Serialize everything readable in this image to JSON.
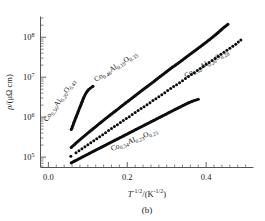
{
  "figure": {
    "panel_label": "(b)",
    "background": "#ffffff",
    "marker_color": "#0d0d0d"
  },
  "axes": {
    "x": {
      "title_base": "T",
      "title_exp": "-1/2",
      "title_unit_open": "/(K",
      "title_unit_exp": "-1/2",
      "title_unit_close": ")",
      "ticks": [
        "0.0",
        "0.2",
        "0.4"
      ],
      "tick_values": [
        0.0,
        0.2,
        0.4
      ],
      "range": [
        -0.02,
        0.52
      ]
    },
    "y": {
      "title_rho": "ρ",
      "title_rest": "/(μΩ cm)",
      "ticks": [
        "10",
        "10",
        "10",
        "10"
      ],
      "tick_exponents": [
        "5",
        "6",
        "7",
        "8"
      ],
      "tick_values": [
        100000,
        1000000,
        10000000,
        100000000
      ],
      "range": [
        55000,
        330000000
      ]
    }
  },
  "chart_data": {
    "type": "scatter",
    "title": "",
    "subtitle": "(b)",
    "xlabel": "T^-1/2 / (K^-1/2)",
    "ylabel": "rho / (micro-ohm cm)",
    "xscale": "linear",
    "yscale": "log",
    "xlim": [
      -0.02,
      0.52
    ],
    "ylim": [
      55000,
      330000000
    ],
    "xticks": [
      0.0,
      0.2,
      0.4
    ],
    "yticks": [
      100000,
      1000000,
      10000000,
      100000000
    ],
    "grid": false,
    "legend": "inline-annotations",
    "series": [
      {
        "name": "Co0.56Al0.20O0.43",
        "label": "Co",
        "label_sub1": "0.56",
        "label_mid": "Al",
        "label_sub2": "0.20",
        "label_mid2": "O",
        "label_sub3": "0.43",
        "marker": "filled-circle",
        "style": "dense",
        "label_angle": -55,
        "label_x": 47,
        "label_y": 122,
        "x": [
          0.058,
          0.062,
          0.066,
          0.07,
          0.074,
          0.078,
          0.082,
          0.086,
          0.09,
          0.094,
          0.098,
          0.102,
          0.106,
          0.11,
          0.113
        ],
        "y": [
          490000,
          620000,
          790000,
          1000000,
          1260000,
          1590000,
          2000000,
          2510000,
          3160000,
          3800000,
          4400000,
          4900000,
          5300000,
          5700000,
          5900000
        ]
      },
      {
        "name": "Co0.46Al0.19O0.35",
        "label": "Co",
        "label_sub1": "0.46",
        "label_mid": "Al",
        "label_sub2": "0.19",
        "label_mid2": "O",
        "label_sub3": "0.35",
        "marker": "filled-circle",
        "style": "dense",
        "label_angle": -33,
        "label_x": 96,
        "label_y": 82,
        "x": [
          0.058,
          0.07,
          0.085,
          0.1,
          0.115,
          0.13,
          0.145,
          0.16,
          0.175,
          0.19,
          0.205,
          0.22,
          0.235,
          0.25,
          0.265,
          0.28,
          0.295,
          0.31,
          0.325,
          0.34,
          0.355,
          0.37,
          0.385,
          0.4,
          0.415,
          0.43,
          0.443,
          0.455
        ],
        "y": [
          175000,
          225000,
          300000,
          400000,
          530000,
          700000,
          920000,
          1200000,
          1560000,
          2050000,
          2650000,
          3450000,
          4500000,
          5800000,
          7500000,
          9800000,
          12700000,
          16500000,
          21000000,
          27000000,
          35000000,
          45000000,
          58000000,
          75000000,
          98000000,
          130000000,
          170000000,
          210000000
        ]
      },
      {
        "name": "Co0.52Al0.20O0.28",
        "label": "Co",
        "label_sub1": "0.52",
        "label_mid": "Al",
        "label_sub2": "0.20",
        "label_mid2": "O",
        "label_sub3": "0.28",
        "marker": "filled-circle",
        "style": "spaced",
        "label_angle": -30,
        "label_x": 186,
        "label_y": 78,
        "x": [
          0.057,
          0.07,
          0.085,
          0.1,
          0.115,
          0.13,
          0.145,
          0.16,
          0.175,
          0.19,
          0.205,
          0.22,
          0.235,
          0.25,
          0.265,
          0.28,
          0.295,
          0.31,
          0.325,
          0.34,
          0.355,
          0.37,
          0.385,
          0.4,
          0.415,
          0.43,
          0.445,
          0.46,
          0.475,
          0.488
        ],
        "y": [
          105000,
          128000,
          162000,
          205000,
          258000,
          325000,
          410000,
          520000,
          650000,
          820000,
          1030000,
          1300000,
          1640000,
          2050000,
          2600000,
          3250000,
          4100000,
          5200000,
          6500000,
          8200000,
          10400000,
          13000000,
          16500000,
          21000000,
          26000000,
          33000000,
          42000000,
          53000000,
          67000000,
          85000000
        ]
      },
      {
        "name": "Co0.54Al0.23O0.25",
        "label": "Co",
        "label_sub1": "0.54",
        "label_mid": "Al",
        "label_sub2": "0.23",
        "label_mid2": "O",
        "label_sub3": "0.25",
        "marker": "filled-circle",
        "style": "dense",
        "label_angle": -22,
        "label_x": 112,
        "label_y": 151,
        "x": [
          0.058,
          0.072,
          0.088,
          0.104,
          0.12,
          0.136,
          0.152,
          0.168,
          0.184,
          0.2,
          0.216,
          0.232,
          0.248,
          0.264,
          0.28,
          0.296,
          0.312,
          0.328,
          0.344,
          0.36,
          0.372,
          0.38
        ],
        "y": [
          72000,
          85000,
          103000,
          124000,
          150000,
          180000,
          218000,
          262000,
          315000,
          380000,
          458000,
          552000,
          665000,
          800000,
          965000,
          1160000,
          1400000,
          1680000,
          2020000,
          2400000,
          2650000,
          2800000
        ]
      }
    ]
  }
}
